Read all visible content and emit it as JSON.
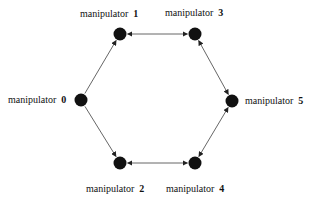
{
  "diagram": {
    "type": "directed-graph",
    "layout": "hexagon",
    "colors": {
      "node": "#111111",
      "edge": "#555555",
      "background": "#ffffff",
      "text": "#111111"
    },
    "nodes": [
      {
        "id": "0",
        "label": "manipulator",
        "number": "0",
        "x": 81,
        "y": 100,
        "label_x": 8,
        "label_y": 95,
        "align": "left"
      },
      {
        "id": "1",
        "label": "manipulator",
        "number": "1",
        "x": 120,
        "y": 34,
        "label_x": 80,
        "label_y": 9,
        "align": "left"
      },
      {
        "id": "3",
        "label": "manipulator",
        "number": "3",
        "x": 195,
        "y": 34,
        "label_x": 165,
        "label_y": 8,
        "align": "left"
      },
      {
        "id": "5",
        "label": "manipulator",
        "number": "5",
        "x": 232,
        "y": 101,
        "label_x": 245,
        "label_y": 96,
        "align": "left"
      },
      {
        "id": "2",
        "label": "manipulator",
        "number": "2",
        "x": 120,
        "y": 163,
        "label_x": 86,
        "label_y": 184,
        "align": "left"
      },
      {
        "id": "4",
        "label": "manipulator",
        "number": "4",
        "x": 195,
        "y": 163,
        "label_x": 166,
        "label_y": 184,
        "align": "left"
      }
    ],
    "edges": [
      {
        "from": "0",
        "to": "1",
        "bidirectional": false
      },
      {
        "from": "0",
        "to": "2",
        "bidirectional": false
      },
      {
        "from": "1",
        "to": "3",
        "bidirectional": true
      },
      {
        "from": "3",
        "to": "5",
        "bidirectional": true
      },
      {
        "from": "5",
        "to": "4",
        "bidirectional": true
      },
      {
        "from": "4",
        "to": "2",
        "bidirectional": true
      }
    ]
  }
}
